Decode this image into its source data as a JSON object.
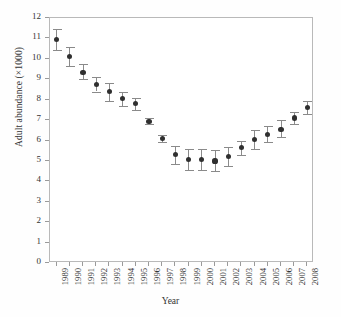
{
  "chart_data": {
    "type": "scatter",
    "title": "",
    "xlabel": "Year",
    "ylabel": "Adult abundance (×1000)",
    "xlim": [
      1988.5,
      2008.5
    ],
    "ylim": [
      0,
      12
    ],
    "grid": false,
    "legend": null,
    "errorbars": true,
    "ytick_labels": [
      "0",
      "1",
      "2",
      "3",
      "4",
      "5",
      "6",
      "7",
      "8",
      "9",
      "10",
      "11",
      "12"
    ],
    "yticks": [
      0,
      1,
      2,
      3,
      4,
      5,
      6,
      7,
      8,
      9,
      10,
      11,
      12
    ],
    "categories": [
      "1989",
      "1990",
      "1991",
      "1992",
      "1993",
      "1994",
      "1995",
      "1996",
      "1997",
      "1998",
      "1999",
      "2000",
      "2001",
      "2002",
      "2003",
      "2004",
      "2005",
      "2006",
      "2007",
      "2008"
    ],
    "values": [
      10.95,
      10.1,
      9.35,
      8.75,
      8.4,
      8.05,
      7.8,
      6.95,
      6.1,
      5.3,
      5.05,
      5.05,
      5.0,
      5.2,
      5.65,
      6.05,
      6.3,
      6.55,
      7.1,
      7.6
    ],
    "err_low": [
      10.45,
      9.65,
      9.0,
      8.4,
      7.95,
      7.7,
      7.5,
      6.8,
      5.95,
      4.85,
      4.55,
      4.55,
      4.5,
      4.75,
      5.3,
      5.6,
      5.95,
      6.15,
      6.8,
      7.3
    ],
    "err_high": [
      11.45,
      10.6,
      9.75,
      9.1,
      8.8,
      8.4,
      8.1,
      7.1,
      6.25,
      5.75,
      5.6,
      5.6,
      5.55,
      5.7,
      6.0,
      6.5,
      6.7,
      7.0,
      7.4,
      7.95
    ],
    "marker": "filled-circle",
    "marker_color": "#2f2f2f",
    "errorbar_color": "#8a8a8a",
    "axis_color": "#b9b9b9"
  }
}
